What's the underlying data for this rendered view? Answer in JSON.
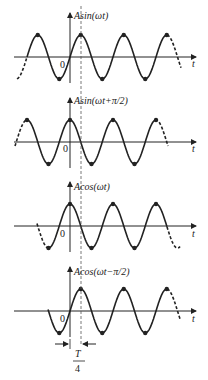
{
  "panels": [
    {
      "label": "Asin(ωt)",
      "origin": "0",
      "axis": "t"
    },
    {
      "label": "Asin(ωt+π/2)",
      "origin": "0",
      "axis": "t"
    },
    {
      "label": "Acos(ωt)",
      "origin": "0",
      "axis": "t"
    },
    {
      "label": "Acos(ωt−π/2)",
      "origin": "0",
      "axis": "t"
    }
  ],
  "annotation": {
    "numerator": "T",
    "denominator": "4"
  }
}
